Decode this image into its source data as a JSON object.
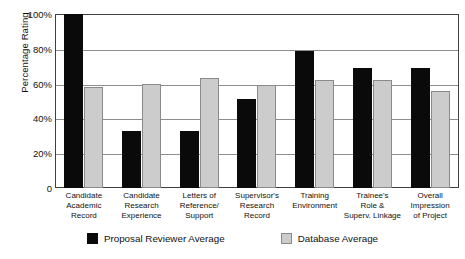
{
  "chart_data": {
    "type": "bar",
    "title": "",
    "xlabel": "",
    "ylabel": "Percentage Rating",
    "ylim": [
      0,
      100
    ],
    "ytick_labels": [
      "100%",
      "80%",
      "60%",
      "40%",
      "20%",
      "0"
    ],
    "ytick_values": [
      100,
      80,
      60,
      40,
      20,
      0
    ],
    "grid": true,
    "legend_position": "bottom",
    "categories": [
      "Candidate Academic Record",
      "Candidate Research Experience",
      "Letters of Reference/ Support",
      "Supervisor's Research Record",
      "Training Environment",
      "Trainee's Role & Superv. Linkage",
      "Overall Impression of Project"
    ],
    "category_lines": [
      [
        "Candidate",
        "Academic",
        "Record"
      ],
      [
        "Candidate",
        "Research",
        "Experience"
      ],
      [
        "Letters of",
        "Reference/",
        "Support"
      ],
      [
        "Supervisor's",
        "Research",
        "Record"
      ],
      [
        "Training",
        "Environment"
      ],
      [
        "Trainee's",
        "Role &",
        "Superv. Linkage"
      ],
      [
        "Overall",
        "Impression",
        "of Project"
      ]
    ],
    "series": [
      {
        "name": "Proposal Reviewer Average",
        "color": "#0a0a0a",
        "values": [
          100,
          33,
          33,
          51,
          79,
          69,
          69
        ]
      },
      {
        "name": "Database Average",
        "color": "#cccccc",
        "values": [
          58,
          60,
          63,
          59,
          62,
          62,
          56
        ]
      }
    ]
  },
  "legend": {
    "items": [
      {
        "label": "Proposal Reviewer Average"
      },
      {
        "label": "Database Average"
      }
    ]
  }
}
